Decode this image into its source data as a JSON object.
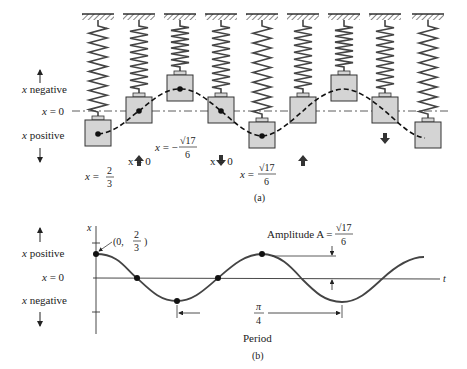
{
  "figure_a": {
    "caption": "(a)",
    "left_labels": {
      "negative": "x negative",
      "zero": "x = 0",
      "positive": "x positive"
    },
    "springs": [
      {
        "x": 98,
        "block_top": 120,
        "state": "stretched"
      },
      {
        "x": 139,
        "block_top": 97,
        "state": "equilibrium",
        "arrow": "up"
      },
      {
        "x": 180,
        "block_top": 75,
        "state": "compressed"
      },
      {
        "x": 221,
        "block_top": 97,
        "state": "equilibrium",
        "arrow": "down"
      },
      {
        "x": 262,
        "block_top": 122,
        "state": "stretched"
      },
      {
        "x": 303,
        "block_top": 97,
        "state": "equilibrium",
        "arrow": "up"
      },
      {
        "x": 344,
        "block_top": 75,
        "state": "compressed"
      },
      {
        "x": 385,
        "block_top": 97,
        "state": "equilibrium",
        "arrow": "down"
      },
      {
        "x": 428,
        "block_top": 122,
        "state": "stretched"
      }
    ],
    "position_labels": [
      {
        "var": "x",
        "eq": "=",
        "sign": "",
        "num": "2",
        "den": "3"
      },
      {
        "text": "x = 0"
      },
      {
        "var": "x",
        "eq": "=",
        "sign": "−",
        "num": "√17",
        "den": "6"
      },
      {
        "text": "x = 0"
      },
      {
        "var": "x",
        "eq": "=",
        "sign": "",
        "num": "√17",
        "den": "6"
      }
    ],
    "colors": {
      "block_fill": "#d4d4d4",
      "stroke": "#333333"
    }
  },
  "figure_b": {
    "caption": "(b)",
    "left_labels": {
      "positive": "x positive",
      "zero": "x = 0",
      "negative": "x negative"
    },
    "axis_y_label": "x",
    "axis_x_label": "t",
    "initial_point_label": {
      "prefix": "(0,",
      "num": "2",
      "den": "3",
      "suffix": ")"
    },
    "amplitude_label": {
      "text": "Amplitude A =",
      "num": "√17",
      "den": "6"
    },
    "period_label": {
      "num": "π",
      "den": "4",
      "text": "Period"
    }
  },
  "chart_data": {
    "type": "line",
    "xlabel": "t",
    "ylabel": "x",
    "series": [
      {
        "name": "x(t)",
        "amplitude": "√17/6",
        "period": "π/4",
        "initial_value": "2/3",
        "marked_points": [
          {
            "label": "(0, 2/3)",
            "type": "start"
          },
          {
            "label": "zero crossing",
            "type": "zero"
          },
          {
            "label": "minimum −√17/6",
            "type": "trough"
          },
          {
            "label": "zero crossing",
            "type": "zero"
          },
          {
            "label": "maximum √17/6",
            "type": "peak"
          }
        ]
      }
    ],
    "annotations": [
      "Amplitude A = √17/6",
      "π/4 Period"
    ],
    "grid": false
  }
}
